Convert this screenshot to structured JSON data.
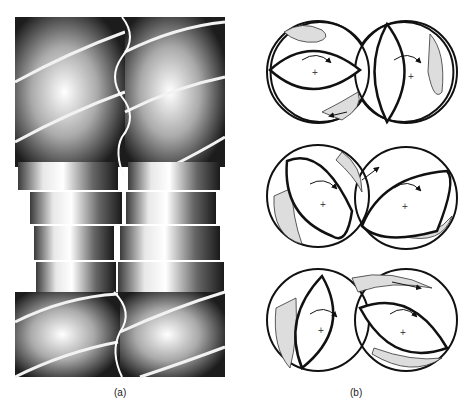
{
  "figure": {
    "panels": [
      {
        "id": "a",
        "caption": "(a)",
        "description": "Intermeshing twin-screw extruder elements: conveying screw flights at top and bottom with a staggered kneading-disc block in the middle",
        "sections": [
          "screw-flights-top",
          "kneading-discs",
          "screw-flights-bottom"
        ]
      },
      {
        "id": "b",
        "caption": "(b)",
        "description": "Cross-sections of co-rotating double-flighted (lens-shaped) kneading elements in a figure-eight barrel at three rotational positions, showing material flow paths",
        "cross_sections": [
          {
            "position": 1,
            "left_rotor": "horizontal",
            "right_rotor": "vertical",
            "rotation": "clockwise"
          },
          {
            "position": 2,
            "left_rotor": "tilted",
            "right_rotor": "tilted",
            "rotation": "clockwise"
          },
          {
            "position": 3,
            "left_rotor": "tilted",
            "right_rotor": "tilted",
            "rotation": "clockwise"
          }
        ]
      }
    ]
  },
  "colors": {
    "ink": "#111111",
    "shade": "#d9d9d9",
    "background": "#ffffff"
  }
}
